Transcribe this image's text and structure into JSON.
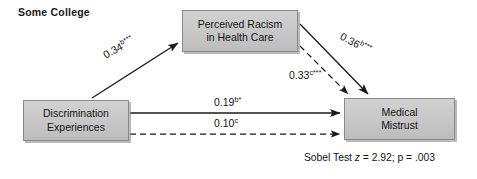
{
  "diagram": {
    "title": "Some College",
    "type": "path-analysis-mediation-model",
    "nodes": {
      "predictor": {
        "label": "Discrimination\nExperiences"
      },
      "mediator": {
        "label": "Perceived Racism\nin Health Care"
      },
      "outcome": {
        "label": "Medical\nMistrust"
      }
    },
    "paths": {
      "a": {
        "coefficient": "0.34",
        "superscript": "b***",
        "style": "solid",
        "from": "predictor",
        "to": "mediator"
      },
      "b": {
        "coefficient": "0.36",
        "superscript": "b***",
        "style": "solid",
        "from": "mediator",
        "to": "outcome"
      },
      "c": {
        "coefficient": "0.33",
        "superscript": "c***",
        "style": "dashed",
        "from": "mediator",
        "to": "outcome"
      },
      "d": {
        "coefficient": "0.19",
        "superscript": "b*",
        "style": "solid",
        "from": "predictor",
        "to": "outcome"
      },
      "e": {
        "coefficient": "0.10",
        "superscript": "c",
        "style": "dashed",
        "from": "predictor",
        "to": "outcome"
      }
    },
    "statistic": {
      "name": "Sobel Test",
      "z_symbol": "z",
      "z_text": " = 2.92; p = .003"
    },
    "colors": {
      "node_fill": "#c6c6c6",
      "node_border": "#8a8a8a",
      "line": "#1a1a1a",
      "text": "#141414",
      "background": "#ffffff"
    }
  }
}
